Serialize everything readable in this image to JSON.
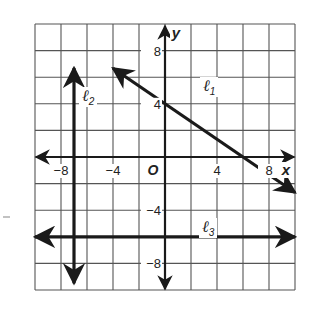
{
  "chart_data": {
    "type": "line",
    "title": "",
    "xlabel": "x",
    "ylabel": "y",
    "xlim": [
      -10,
      10
    ],
    "ylim": [
      -10,
      10
    ],
    "grid": true,
    "grid_step": 2,
    "origin_label": "O",
    "x_ticks": [
      {
        "value": -8,
        "label": "−8"
      },
      {
        "value": -4,
        "label": "−4"
      },
      {
        "value": 4,
        "label": "4"
      },
      {
        "value": 8,
        "label": "8"
      }
    ],
    "y_ticks": [
      {
        "value": 8,
        "label": "8"
      },
      {
        "value": 4,
        "label": "4"
      },
      {
        "value": -4,
        "label": "−4"
      },
      {
        "value": -8,
        "label": "−8"
      }
    ],
    "series": [
      {
        "name": "ℓ1",
        "label_main": "ℓ",
        "label_sub": "1",
        "equation": "y = -2/3 x + 4",
        "points": [
          [
            -4,
            6.67
          ],
          [
            0,
            4
          ],
          [
            6,
            0
          ],
          [
            10,
            -2.67
          ]
        ]
      },
      {
        "name": "ℓ2",
        "label_main": "ℓ",
        "label_sub": "2",
        "equation": "x = -7",
        "points": [
          [
            -7,
            6.7
          ],
          [
            -7,
            -9.5
          ]
        ]
      },
      {
        "name": "ℓ3",
        "label_main": "ℓ",
        "label_sub": "3",
        "equation": "y = -6",
        "points": [
          [
            -10,
            -6
          ],
          [
            10,
            -6
          ]
        ]
      }
    ],
    "legend": "none (lines labeled directly)"
  },
  "colors": {
    "grid": "#555555",
    "line": "#1a1a1a",
    "background": "#ffffff"
  }
}
